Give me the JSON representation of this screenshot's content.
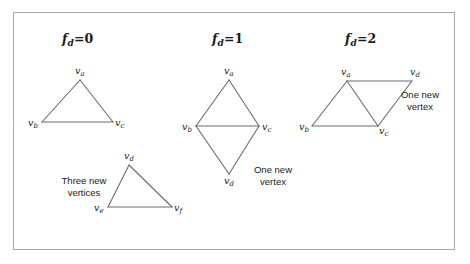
{
  "figure": {
    "background_color": "#ffffff",
    "border_color": "#a9a9a9",
    "stroke_color": "#6b6b6b",
    "text_color": "#1a1a1a"
  },
  "panels": [
    {
      "id": "fd0",
      "title": {
        "symbol": "f",
        "subscript": "d",
        "equals": "=",
        "value": "0"
      },
      "title_full": "f_d = 0",
      "shapes": [
        {
          "name": "original-triangle",
          "vertices": [
            {
              "label": "v",
              "sub": "a",
              "x": 80,
              "y": 80
            },
            {
              "label": "v",
              "sub": "b",
              "x": 42,
              "y": 122
            },
            {
              "label": "v",
              "sub": "c",
              "x": 113,
              "y": 122
            }
          ]
        },
        {
          "name": "new-triangle",
          "vertices": [
            {
              "label": "v",
              "sub": "d",
              "x": 129,
              "y": 165
            },
            {
              "label": "v",
              "sub": "e",
              "x": 108,
              "y": 207
            },
            {
              "label": "v",
              "sub": "f",
              "x": 172,
              "y": 207
            }
          ]
        }
      ],
      "annotation": {
        "line1": "Three new",
        "line2": "vertices"
      }
    },
    {
      "id": "fd1",
      "title": {
        "symbol": "f",
        "subscript": "d",
        "equals": "=",
        "value": "1"
      },
      "title_full": "f_d = 1",
      "shapes": [
        {
          "name": "kite",
          "vertices": [
            {
              "label": "v",
              "sub": "a",
              "x": 229,
              "y": 80
            },
            {
              "label": "v",
              "sub": "b",
              "x": 196,
              "y": 126
            },
            {
              "label": "v",
              "sub": "c",
              "x": 259,
              "y": 126
            },
            {
              "label": "v",
              "sub": "d",
              "x": 229,
              "y": 174
            }
          ]
        }
      ],
      "annotation": {
        "line1": "One new",
        "line2": "vertex"
      }
    },
    {
      "id": "fd2",
      "title": {
        "symbol": "f",
        "subscript": "d",
        "equals": "=",
        "value": "2"
      },
      "title_full": "f_d = 2",
      "shapes": [
        {
          "name": "parallelogram",
          "vertices": [
            {
              "label": "v",
              "sub": "a",
              "x": 347,
              "y": 81
            },
            {
              "label": "v",
              "sub": "d",
              "x": 412,
              "y": 81
            },
            {
              "label": "v",
              "sub": "b",
              "x": 312,
              "y": 126
            },
            {
              "label": "v",
              "sub": "c",
              "x": 378,
              "y": 126
            }
          ]
        }
      ],
      "annotation": {
        "line1": "One new",
        "line2": "vertex"
      }
    }
  ]
}
